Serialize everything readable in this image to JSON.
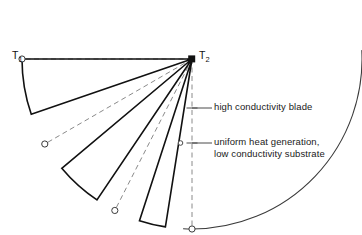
{
  "figure": {
    "type": "technical-line-diagram"
  },
  "labels": {
    "t1": "T",
    "t1_sub": "1",
    "t2": "T",
    "t2_sub": "2",
    "blade": "high conductivity blade",
    "substrate_line1": "uniform heat generation,",
    "substrate_line2": "low conductivity substrate"
  },
  "colors": {
    "outline": "#3a3a3a",
    "blade": "#111111",
    "dashed": "#8a8a8a",
    "text": "#1a1a1a",
    "background": "#ffffff",
    "marker_fill": "#ffffff"
  },
  "geometry": {
    "apex": {
      "x": 192,
      "y": 59
    },
    "radius": 170,
    "arc_start_deg": 93,
    "arc_end_deg": 357,
    "blades": [
      {
        "name": "blade-1",
        "edge_a_deg": 180.0,
        "edge_b_deg": 161.0
      },
      {
        "name": "blade-2",
        "edge_a_deg": 140.0,
        "edge_b_deg": 124.0
      },
      {
        "name": "blade-3",
        "edge_a_deg": 108.0,
        "edge_b_deg": 99.0
      }
    ],
    "dashed_rays_deg": [
      180,
      150,
      117,
      90
    ],
    "arc_markers_deg": [
      180,
      150,
      117,
      90
    ],
    "apex_marker": "filled-square"
  },
  "annotations": {
    "blade_leader": {
      "tick_x": 192,
      "tick_y": 108,
      "text_x": 214
    },
    "substrate_leader": {
      "marker_x": 180,
      "marker_y": 143,
      "tick_x": 192,
      "tick_y": 143,
      "text_x": 214
    }
  }
}
